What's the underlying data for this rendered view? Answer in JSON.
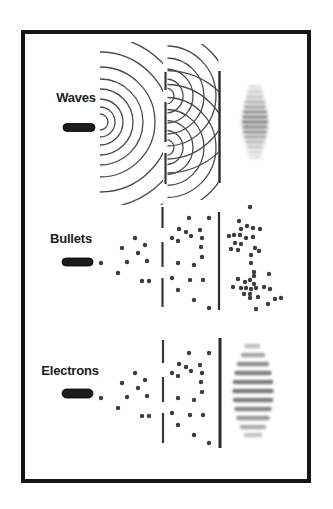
{
  "figure_type": "double-slit-experiment-diagram",
  "colors": {
    "background": "#ffffff",
    "frame": "#161616",
    "label_ink": "#1b1b1b",
    "source_ink": "#1c1c1c",
    "arc_line": "#4a4a4a",
    "barrier_line": "#383838",
    "screen_line": "#2c2c2c",
    "dot": "#3d3d3d",
    "pattern_ink": "#2a2a2a"
  },
  "rows": [
    {
      "id": "waves",
      "label": "Waves"
    },
    {
      "id": "bullets",
      "label": "Bullets"
    },
    {
      "id": "electrons",
      "label": "Electrons"
    }
  ],
  "diagram": {
    "frame": {
      "x": 23,
      "y": 32,
      "w": 286,
      "h": 449,
      "stroke_w": 4
    },
    "waves": {
      "source_pill": [
        63,
        123.5,
        32,
        8
      ],
      "source_arc_center": [
        100,
        122
      ],
      "source_arc_radii": [
        8,
        15,
        23,
        33,
        43,
        55,
        70,
        86,
        103
      ],
      "slit_arc_centers": [
        [
          166,
          96
        ],
        [
          166,
          147.5
        ]
      ],
      "slit_arc_radii": [
        8,
        17,
        27,
        38,
        50,
        63,
        77
      ],
      "barrier": {
        "x": 165.5,
        "w": 2.2,
        "segments": [
          [
            72,
            90
          ],
          [
            102,
            142
          ],
          [
            153,
            184
          ]
        ]
      },
      "screen": {
        "x": 219.5,
        "w": 2.4,
        "y1": 71,
        "y2": 183
      },
      "pattern": {
        "cx": 255,
        "stripe_h": 2.6,
        "stripes": [
          [
            87,
            10,
            0.22
          ],
          [
            92,
            13,
            0.32
          ],
          [
            97,
            15,
            0.42
          ],
          [
            102,
            18,
            0.52
          ],
          [
            107,
            20,
            0.62
          ],
          [
            112,
            22,
            0.72
          ],
          [
            117,
            23,
            0.78
          ],
          [
            122,
            24,
            0.82
          ],
          [
            127,
            23,
            0.78
          ],
          [
            132,
            22,
            0.7
          ],
          [
            137,
            20,
            0.58
          ],
          [
            142,
            17,
            0.48
          ],
          [
            147,
            14,
            0.38
          ],
          [
            152,
            12,
            0.28
          ],
          [
            157,
            10,
            0.2
          ]
        ]
      }
    },
    "bullets": {
      "source_pill": [
        62,
        258,
        31,
        8
      ],
      "barrier": {
        "x": 162.5,
        "w": 2.2,
        "segments": [
          [
            207,
            228
          ],
          [
            242,
            267
          ],
          [
            278,
            307
          ]
        ]
      },
      "screen": {
        "x": 219,
        "w": 2.2,
        "y1": 212,
        "y2": 310
      },
      "dots_before": [
        [
          101,
          263
        ],
        [
          118,
          273
        ],
        [
          122,
          248
        ],
        [
          127,
          262
        ],
        [
          135,
          238
        ],
        [
          138,
          253
        ],
        [
          145,
          245
        ],
        [
          147,
          261
        ],
        [
          142,
          281
        ],
        [
          149,
          281
        ]
      ],
      "dots_middle": [
        [
          189,
          218
        ],
        [
          209,
          218
        ],
        [
          179,
          229
        ],
        [
          186,
          232
        ],
        [
          200,
          230
        ],
        [
          172,
          238
        ],
        [
          191,
          236
        ],
        [
          202,
          238
        ],
        [
          178,
          241
        ],
        [
          201,
          247
        ],
        [
          202,
          257
        ],
        [
          178,
          263
        ],
        [
          194,
          265
        ],
        [
          172,
          278
        ],
        [
          190,
          280
        ],
        [
          203,
          280
        ],
        [
          178,
          290
        ],
        [
          194,
          300
        ],
        [
          209,
          308
        ]
      ],
      "dots_after": [
        [
          250,
          207
        ],
        [
          239,
          221
        ],
        [
          247,
          226
        ],
        [
          241,
          229
        ],
        [
          253,
          228
        ],
        [
          260,
          229
        ],
        [
          229,
          236
        ],
        [
          234,
          235
        ],
        [
          240,
          235
        ],
        [
          246,
          238
        ],
        [
          253,
          237
        ],
        [
          235,
          243
        ],
        [
          241,
          244
        ],
        [
          231,
          249
        ],
        [
          238,
          250
        ],
        [
          255,
          248
        ],
        [
          259,
          251
        ],
        [
          251,
          255
        ],
        [
          251,
          263
        ],
        [
          254,
          272
        ],
        [
          254,
          276
        ],
        [
          269,
          274
        ],
        [
          238,
          279
        ],
        [
          245,
          282
        ],
        [
          250,
          280
        ],
        [
          254,
          284
        ],
        [
          233,
          287
        ],
        [
          241,
          288
        ],
        [
          246,
          288
        ],
        [
          251,
          289
        ],
        [
          256,
          288
        ],
        [
          264,
          287
        ],
        [
          270,
          289
        ],
        [
          244,
          294
        ],
        [
          250,
          294
        ],
        [
          250,
          298
        ],
        [
          258,
          297
        ],
        [
          275,
          299
        ],
        [
          281,
          298
        ],
        [
          268,
          304
        ],
        [
          256,
          309
        ]
      ]
    },
    "electrons": {
      "source_pill": [
        62,
        389,
        31,
        9
      ],
      "barrier": {
        "x": 163,
        "w": 2.2,
        "segments": [
          [
            340,
            363
          ],
          [
            377,
            402
          ],
          [
            413,
            443
          ]
        ]
      },
      "screen": {
        "x": 220,
        "w": 3,
        "y1": 338,
        "y2": 448
      },
      "dots_before": [
        [
          101,
          398
        ],
        [
          118,
          408
        ],
        [
          122,
          383
        ],
        [
          127,
          397
        ],
        [
          135,
          373
        ],
        [
          138,
          388
        ],
        [
          145,
          380
        ],
        [
          147,
          396
        ],
        [
          142,
          416
        ],
        [
          149,
          416
        ]
      ],
      "dots_middle": [
        [
          189,
          353
        ],
        [
          209,
          353
        ],
        [
          179,
          364
        ],
        [
          186,
          367
        ],
        [
          200,
          365
        ],
        [
          172,
          373
        ],
        [
          191,
          371
        ],
        [
          202,
          373
        ],
        [
          178,
          376
        ],
        [
          201,
          382
        ],
        [
          202,
          392
        ],
        [
          178,
          398
        ],
        [
          194,
          400
        ],
        [
          172,
          413
        ],
        [
          190,
          415
        ],
        [
          203,
          415
        ],
        [
          178,
          425
        ],
        [
          194,
          435
        ],
        [
          209,
          443
        ]
      ],
      "pattern": {
        "cx": 253,
        "stripe_h": 4.5,
        "stripes": [
          [
            346,
            13,
            0.3
          ],
          [
            355,
            20,
            0.42
          ],
          [
            364,
            28,
            0.52
          ],
          [
            373,
            33,
            0.58
          ],
          [
            382,
            36,
            0.62
          ],
          [
            391,
            37,
            0.64
          ],
          [
            400,
            36,
            0.6
          ],
          [
            409,
            33,
            0.55
          ],
          [
            418,
            29,
            0.48
          ],
          [
            427,
            22,
            0.38
          ],
          [
            435,
            14,
            0.28
          ]
        ]
      }
    }
  }
}
